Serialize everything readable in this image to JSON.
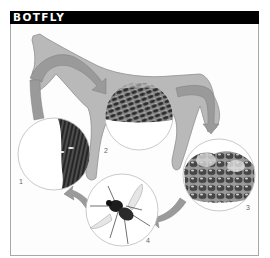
{
  "title": "BOTFLY",
  "stages": [
    {
      "number": "1",
      "depiction": "eggs-on-horse-hair"
    },
    {
      "number": "2",
      "depiction": "larvae-in-stomach-lining"
    },
    {
      "number": "3",
      "depiction": "pupae-in-dung"
    },
    {
      "number": "4",
      "depiction": "adult-botfly"
    }
  ],
  "colors": {
    "header_bg": "#000000",
    "header_text": "#ffffff",
    "horse": "#b9b9b9",
    "arrow": "#9a9a9a",
    "circle_border": "#bdbdbd",
    "label": "#666666"
  }
}
